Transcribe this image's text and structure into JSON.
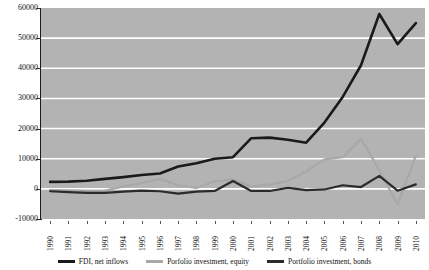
{
  "chart_data": {
    "type": "line",
    "title": "",
    "xlabel": "",
    "ylabel": "",
    "x": [
      1990,
      1991,
      1992,
      1993,
      1994,
      1995,
      1996,
      1997,
      1998,
      1999,
      2000,
      2001,
      2002,
      2003,
      2004,
      2005,
      2006,
      2007,
      2008,
      2009,
      2010
    ],
    "categories": [
      "1990",
      "1991",
      "1992",
      "1993",
      "1994",
      "1995",
      "1996",
      "1997",
      "1998",
      "1999",
      "2000",
      "2001",
      "2002",
      "2003",
      "2004",
      "2005",
      "2006",
      "2007",
      "2008",
      "2009",
      "2010"
    ],
    "ylim": [
      -10000,
      60000
    ],
    "yticks": [
      -10000,
      0,
      10000,
      20000,
      30000,
      40000,
      50000,
      60000
    ],
    "ytick_labels": [
      "-10000",
      "0",
      "10000",
      "20000",
      "30000",
      "40000",
      "50000",
      "60000"
    ],
    "grid": true,
    "grid_color": "#ffffff",
    "plot_background": "#b3b3b3",
    "legend_position": "bottom",
    "series": [
      {
        "name": "FDI, net inflows",
        "color": "#1a1a1a",
        "width": 2.6,
        "values": [
          2300,
          2400,
          2700,
          3300,
          3900,
          4600,
          5100,
          7400,
          8500,
          10000,
          10500,
          16800,
          17000,
          16300,
          15300,
          22000,
          30500,
          41000,
          58000,
          48000,
          55000
        ]
      },
      {
        "name": "Porfolio investment, equity",
        "color": "#a8a8a8",
        "width": 2.2,
        "values": [
          -400,
          -500,
          -700,
          -600,
          800,
          1900,
          3300,
          1200,
          300,
          2500,
          3200,
          800,
          1400,
          2600,
          5800,
          9800,
          10500,
          16600,
          6200,
          -5200,
          11000
        ]
      },
      {
        "name": "Portfolio investment, bonds",
        "color": "#2b2b2b",
        "width": 2.2,
        "values": [
          -800,
          -1100,
          -1300,
          -1300,
          -900,
          -600,
          -800,
          -1600,
          -900,
          -700,
          2600,
          -700,
          -700,
          300,
          -400,
          -200,
          1200,
          600,
          4300,
          -600,
          1500
        ]
      }
    ]
  },
  "legend": {
    "items": [
      {
        "label": "FDI, net inflows",
        "color": "#1a1a1a"
      },
      {
        "label": "Porfolio investment, equity",
        "color": "#a8a8a8"
      },
      {
        "label": "Portfolio investment, bonds",
        "color": "#2b2b2b"
      }
    ]
  }
}
